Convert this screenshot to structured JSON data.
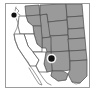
{
  "figure": {
    "type": "choropleth-locator-map",
    "region": "Western United States",
    "width": 97,
    "height": 94,
    "background_color": "#ffffff",
    "frame": {
      "border_color": "#9b9b9b",
      "border_width": 1,
      "fill_color": "#ffffff"
    },
    "colors": {
      "highlighted_state_fill": "#9a9a9a",
      "unhighlighted_state_fill": "#ffffff",
      "state_border": "#4a4a4a",
      "coastline": "#6e6e6e",
      "marker_fill": "#111111",
      "marker_halo": "#ffffff"
    },
    "states": [
      {
        "name": "Washington",
        "code": "WA",
        "highlighted": true
      },
      {
        "name": "Oregon",
        "code": "OR",
        "highlighted": false
      },
      {
        "name": "Idaho",
        "code": "ID",
        "highlighted": true
      },
      {
        "name": "Montana",
        "code": "MT",
        "highlighted": true
      },
      {
        "name": "Wyoming",
        "code": "WY",
        "highlighted": true
      },
      {
        "name": "North Dakota",
        "code": "ND",
        "highlighted": true
      },
      {
        "name": "South Dakota",
        "code": "SD",
        "highlighted": true
      },
      {
        "name": "Nebraska",
        "code": "NE",
        "highlighted": true
      },
      {
        "name": "Kansas",
        "code": "KS",
        "highlighted": true
      },
      {
        "name": "Colorado",
        "code": "CO",
        "highlighted": true
      },
      {
        "name": "Utah",
        "code": "UT",
        "highlighted": true
      },
      {
        "name": "Nevada",
        "code": "NV",
        "highlighted": false
      },
      {
        "name": "California",
        "code": "CA",
        "highlighted": false
      },
      {
        "name": "Arizona",
        "code": "AZ",
        "highlighted": false
      },
      {
        "name": "New Mexico",
        "code": "NM",
        "highlighted": true
      },
      {
        "name": "Texas",
        "code": "TX",
        "highlighted": true
      },
      {
        "name": "Oklahoma",
        "code": "OK",
        "highlighted": true
      }
    ],
    "markers": [
      {
        "id": "marker-northwest",
        "label": "",
        "x": 12,
        "y": 13,
        "radius": 2.6
      },
      {
        "id": "marker-southwest",
        "label": "",
        "x": 50,
        "y": 57,
        "radius": 3.2
      }
    ]
  }
}
